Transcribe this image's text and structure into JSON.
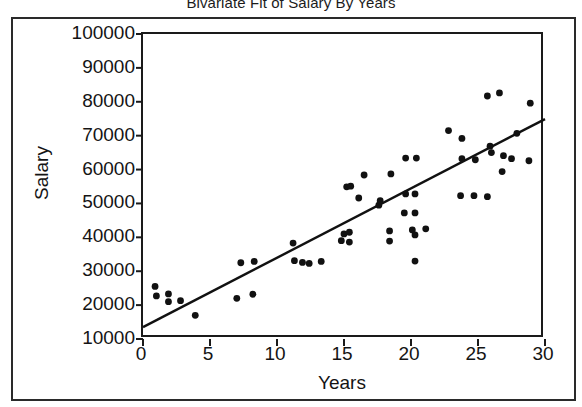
{
  "chart_data": {
    "type": "scatter",
    "title": "Bivariate Fit of Salary By Years",
    "xlabel": "Years",
    "ylabel": "Salary",
    "xlim": [
      0,
      30
    ],
    "ylim": [
      10000,
      100000
    ],
    "grid": false,
    "legend": null,
    "xticks": [
      0,
      5,
      10,
      15,
      20,
      25,
      30
    ],
    "xtick_labels": [
      "0",
      "5",
      "10",
      "15",
      "20",
      "25",
      "30"
    ],
    "yticks": [
      10000,
      20000,
      30000,
      40000,
      50000,
      60000,
      70000,
      80000,
      90000,
      100000
    ],
    "ytick_labels": [
      "10000",
      "20000",
      "30000",
      "40000",
      "50000",
      "60000",
      "70000",
      "80000",
      "90000",
      "100000"
    ],
    "marker": "filled-circle",
    "marker_color": "#111111",
    "points": [
      [
        0.9,
        25500
      ],
      [
        1.0,
        22700
      ],
      [
        1.9,
        23300
      ],
      [
        1.9,
        21000
      ],
      [
        2.8,
        21300
      ],
      [
        3.9,
        17000
      ],
      [
        7.0,
        22000
      ],
      [
        7.3,
        32500
      ],
      [
        8.2,
        23200
      ],
      [
        8.3,
        32900
      ],
      [
        11.2,
        38300
      ],
      [
        11.3,
        33100
      ],
      [
        11.9,
        32600
      ],
      [
        12.4,
        32300
      ],
      [
        13.3,
        32900
      ],
      [
        14.8,
        39000
      ],
      [
        15.0,
        41000
      ],
      [
        15.2,
        54900
      ],
      [
        15.4,
        41500
      ],
      [
        15.4,
        38600
      ],
      [
        15.5,
        55100
      ],
      [
        16.1,
        51600
      ],
      [
        16.5,
        58400
      ],
      [
        17.6,
        49500
      ],
      [
        17.7,
        50800
      ],
      [
        18.4,
        41900
      ],
      [
        18.4,
        38900
      ],
      [
        18.5,
        58700
      ],
      [
        19.5,
        47200
      ],
      [
        19.6,
        63400
      ],
      [
        19.6,
        52800
      ],
      [
        20.1,
        42200
      ],
      [
        20.3,
        52800
      ],
      [
        20.3,
        47200
      ],
      [
        20.3,
        40700
      ],
      [
        20.4,
        63400
      ],
      [
        20.3,
        33000
      ],
      [
        21.1,
        42500
      ],
      [
        22.8,
        71500
      ],
      [
        23.7,
        52300
      ],
      [
        23.8,
        69200
      ],
      [
        23.8,
        63200
      ],
      [
        24.7,
        52300
      ],
      [
        24.8,
        62900
      ],
      [
        25.7,
        81700
      ],
      [
        25.7,
        52000
      ],
      [
        25.9,
        66900
      ],
      [
        26.0,
        65000
      ],
      [
        26.6,
        82600
      ],
      [
        26.8,
        59400
      ],
      [
        26.9,
        64100
      ],
      [
        27.5,
        63200
      ],
      [
        27.9,
        70700
      ],
      [
        28.8,
        62600
      ],
      [
        28.9,
        79600
      ]
    ],
    "fit_line": {
      "type": "linear-regression",
      "x_start": 0,
      "y_start": 13500,
      "x_end": 30,
      "y_end": 74900,
      "color": "#111111"
    }
  }
}
